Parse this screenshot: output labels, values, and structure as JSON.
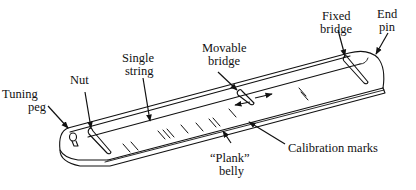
{
  "diagram": {
    "labels": {
      "tuning_peg": [
        "Tuning",
        "peg"
      ],
      "nut": [
        "Nut"
      ],
      "single_string": [
        "Single",
        "string"
      ],
      "movable_bridge": [
        "Movable",
        "bridge"
      ],
      "fixed_bridge": [
        "Fixed",
        "bridge"
      ],
      "end_pin": [
        "End",
        "pin"
      ],
      "calibration_marks": [
        "Calibration marks"
      ],
      "plank_belly": [
        "“Plank”",
        "belly"
      ]
    },
    "colors": {
      "ink": "#111111",
      "background": "#ffffff"
    }
  }
}
